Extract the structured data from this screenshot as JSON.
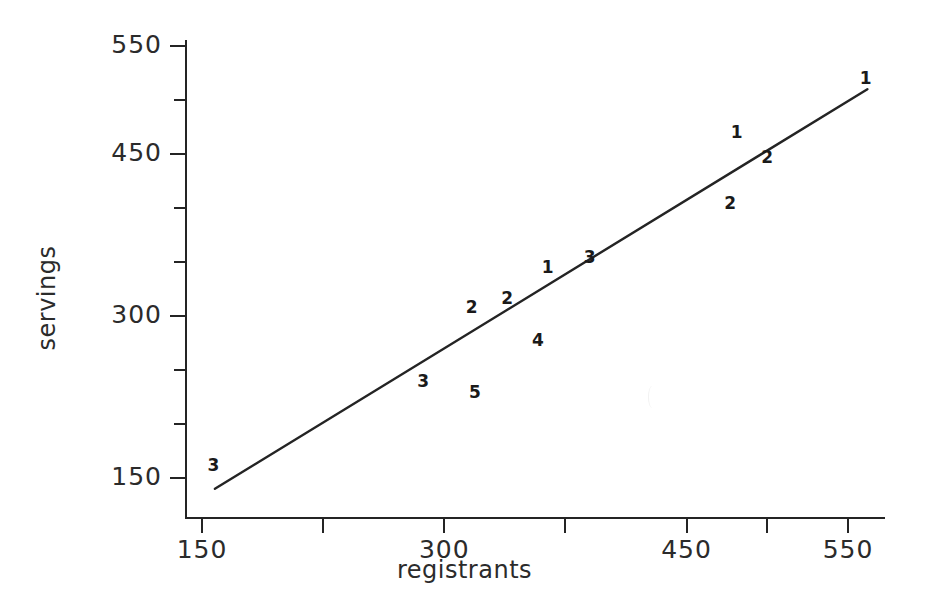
{
  "chart_data": {
    "type": "scatter",
    "title": "",
    "xlabel": "registrants",
    "ylabel": "servings",
    "xlim": [
      150,
      580
    ],
    "ylim": [
      130,
      570
    ],
    "grid": false,
    "legend": null,
    "x_ticks_major": [
      {
        "value": 150,
        "label": "150"
      },
      {
        "value": 300,
        "label": "300"
      },
      {
        "value": 450,
        "label": "450"
      },
      {
        "value": 550,
        "label": "550"
      }
    ],
    "x_ticks_minor": [
      225,
      375,
      500
    ],
    "y_ticks_major": [
      {
        "value": 550,
        "label": "550"
      },
      {
        "value": 450,
        "label": "450"
      },
      {
        "value": 300,
        "label": "300"
      },
      {
        "value": 150,
        "label": "150"
      }
    ],
    "y_ticks_minor": [
      500,
      400,
      350,
      250,
      200
    ],
    "points": [
      {
        "label": "3",
        "count": 3,
        "x": 157,
        "y": 162
      },
      {
        "label": "3",
        "count": 3,
        "x": 287,
        "y": 240
      },
      {
        "label": "5",
        "count": 5,
        "x": 319,
        "y": 230
      },
      {
        "label": "2",
        "count": 2,
        "x": 317,
        "y": 308
      },
      {
        "label": "2",
        "count": 2,
        "x": 339,
        "y": 317
      },
      {
        "label": "4",
        "count": 4,
        "x": 358,
        "y": 278
      },
      {
        "label": "1",
        "count": 1,
        "x": 364,
        "y": 345
      },
      {
        "label": "3",
        "count": 3,
        "x": 390,
        "y": 355
      },
      {
        "label": "1",
        "count": 1,
        "x": 481,
        "y": 470
      },
      {
        "label": "2",
        "count": 2,
        "x": 477,
        "y": 405
      },
      {
        "label": "2",
        "count": 2,
        "x": 500,
        "y": 447
      },
      {
        "label": "1",
        "count": 1,
        "x": 561,
        "y": 520
      }
    ],
    "regression_line": {
      "x_start": 158,
      "y_start": 140,
      "x_end": 562,
      "y_end": 510
    }
  },
  "axes": {
    "x_tick_labels": [
      "150",
      "300",
      "450",
      "550"
    ],
    "y_tick_labels": [
      "550",
      "450",
      "300",
      "150"
    ],
    "x_title": "registrants",
    "y_title": "servings"
  },
  "style": {
    "ink_color": "#242424",
    "text_color": "#2b2b2b",
    "background": "#ffffff"
  }
}
